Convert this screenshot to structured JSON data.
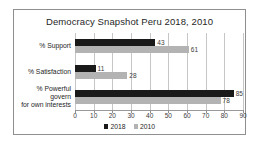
{
  "chart_data": {
    "type": "bar",
    "orientation": "horizontal",
    "title": "Democracy Snapshot Peru 2018, 2010",
    "categories": [
      "% Support",
      "% Satisfaction",
      "% Powerful govern\nfor own interests"
    ],
    "series": [
      {
        "name": "2018",
        "color": "#1a1a1a",
        "values": [
          43,
          11,
          85
        ]
      },
      {
        "name": "2010",
        "color": "#b3b3b3",
        "values": [
          61,
          28,
          78
        ]
      }
    ],
    "xlim": [
      0,
      90
    ],
    "xticks": [
      0,
      10,
      20,
      30,
      40,
      50,
      60,
      70,
      80,
      90
    ],
    "grid": true,
    "legend_position": "bottom",
    "value_labels": true,
    "colors": {
      "frame_border": "#8f8f8f",
      "gridline": "#c6c6c6",
      "axis_line": "#9a9a9a",
      "text": "#262626",
      "background": "#ffffff"
    }
  }
}
